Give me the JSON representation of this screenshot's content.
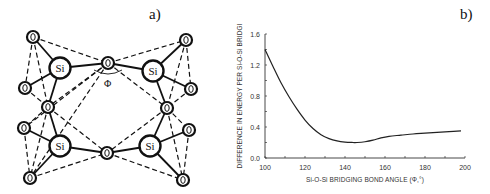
{
  "panels": {
    "a": {
      "label": "a)"
    },
    "b": {
      "label": "b)"
    }
  },
  "diagram": {
    "angle_symbol": "Φ",
    "si_label": "Si",
    "o_label": "O",
    "si_atoms": [
      {
        "x": 60,
        "y": 68
      },
      {
        "x": 153,
        "y": 71
      },
      {
        "x": 60,
        "y": 146
      },
      {
        "x": 150,
        "y": 146
      }
    ],
    "o_atoms": [
      {
        "x": 33,
        "y": 37
      },
      {
        "x": 25,
        "y": 88
      },
      {
        "x": 48,
        "y": 107
      },
      {
        "x": 108,
        "y": 63
      },
      {
        "x": 186,
        "y": 40
      },
      {
        "x": 191,
        "y": 89
      },
      {
        "x": 167,
        "y": 108
      },
      {
        "x": 24,
        "y": 128
      },
      {
        "x": 30,
        "y": 178
      },
      {
        "x": 107,
        "y": 153
      },
      {
        "x": 189,
        "y": 130
      },
      {
        "x": 183,
        "y": 180
      }
    ]
  },
  "chart_data": {
    "type": "line",
    "title": "",
    "xlabel": "Si-O-Si BRIDGING BOND ANGLE (Φ,°)",
    "ylabel": "DIFFERENCE IN ENERGY PER Si-O-Si BRIDGI",
    "xlim": [
      100,
      200
    ],
    "ylim": [
      0.0,
      1.6
    ],
    "xticks": [
      100,
      120,
      140,
      160,
      180,
      200
    ],
    "xtick_labels": [
      "100",
      "120",
      "140",
      "160",
      "180",
      "200"
    ],
    "yticks": [
      0.0,
      0.4,
      0.8,
      1.2,
      1.6
    ],
    "ytick_labels": [
      "0.0",
      "0.4",
      "0.8",
      "1.2",
      "1.6"
    ],
    "grid": false,
    "legend": null,
    "series": [
      {
        "name": "energy difference",
        "x": [
          100,
          104,
          108,
          112,
          116,
          120,
          124,
          128,
          132,
          136,
          140,
          144,
          146,
          150,
          154,
          158,
          162,
          168,
          174,
          180,
          186,
          192,
          198
        ],
        "y": [
          1.4,
          1.18,
          0.97,
          0.79,
          0.63,
          0.49,
          0.38,
          0.3,
          0.25,
          0.22,
          0.205,
          0.2,
          0.2,
          0.21,
          0.23,
          0.26,
          0.28,
          0.295,
          0.31,
          0.32,
          0.33,
          0.34,
          0.35
        ]
      }
    ]
  }
}
